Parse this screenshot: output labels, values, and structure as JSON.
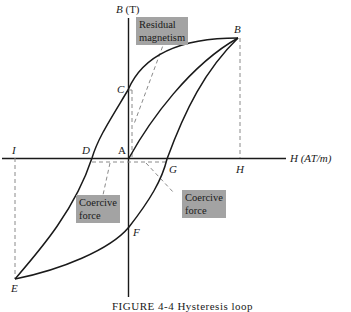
{
  "diagram": {
    "type": "B-H hysteresis loop",
    "axes": {
      "y_label_var": "B",
      "y_label_unit": "(T)",
      "x_label_var": "H",
      "x_label_unit": "(AT/m)"
    },
    "points": {
      "A": "A",
      "B": "B",
      "C": "C",
      "D": "D",
      "E": "E",
      "F": "F",
      "G": "G",
      "H": "H",
      "I": "I"
    },
    "callouts": {
      "residual_line1": "Residual",
      "residual_line2": "magnetism",
      "coercive_left_line1": "Coercive",
      "coercive_left_line2": "force",
      "coercive_right_line1": "Coercive",
      "coercive_right_line2": "force"
    },
    "colors": {
      "curve": "#1a1a1a",
      "dashed": "#8a8a8a",
      "callout_bg": "#a3a3a3"
    },
    "caption": "FIGURE 4-4   Hysteresis loop"
  }
}
